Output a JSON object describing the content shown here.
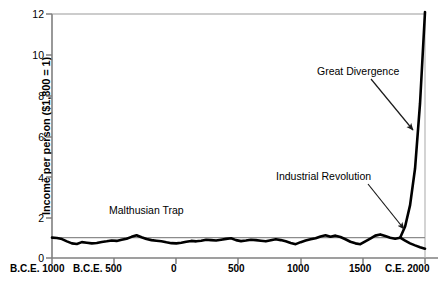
{
  "chart_data": {
    "type": "line",
    "title": "",
    "xlabel": "",
    "ylabel": "Income per person ($1,800 = 1)",
    "xlim": [
      -1000,
      2000
    ],
    "ylim": [
      0,
      12
    ],
    "grid": false,
    "legend": "none",
    "y_ticks": [
      "12",
      "10",
      "8",
      "6",
      "4",
      "2",
      "0"
    ],
    "y_tick_values": [
      12,
      10,
      8,
      6,
      4,
      2,
      0
    ],
    "x_ticks": [
      "B.C.E. 1000",
      "B.C.E. 500",
      "0",
      "500",
      "1000",
      "1500",
      "C.E. 2000"
    ],
    "x_tick_values": [
      -1000,
      -500,
      0,
      500,
      1000,
      1500,
      2000
    ],
    "reference_line": {
      "label": "",
      "y": 1,
      "color": "#8c8c8c"
    },
    "annotations": [
      {
        "name": "malthusian-trap",
        "text": "Malthusian Trap",
        "x": 470,
        "y": 2.0
      },
      {
        "name": "industrial-revolution",
        "text": "Industrial Revolution",
        "x": 1430,
        "y": 4.0
      },
      {
        "name": "great-divergence",
        "text": "Great Divergence",
        "x": 1600,
        "y": 9.1
      }
    ],
    "series": [
      {
        "name": "World income per person (Malthusian era and Great Divergence)",
        "color": "#000000",
        "x": [
          -1000,
          -960,
          -920,
          -880,
          -840,
          -800,
          -760,
          -720,
          -680,
          -640,
          -600,
          -560,
          -520,
          -480,
          -440,
          -400,
          -360,
          -320,
          -280,
          -240,
          -200,
          -160,
          -120,
          -80,
          -40,
          0,
          40,
          80,
          120,
          160,
          200,
          240,
          280,
          320,
          360,
          400,
          440,
          480,
          520,
          560,
          600,
          640,
          680,
          720,
          760,
          800,
          840,
          880,
          920,
          960,
          1000,
          1040,
          1080,
          1120,
          1160,
          1200,
          1240,
          1280,
          1320,
          1360,
          1400,
          1440,
          1480,
          1520,
          1560,
          1600,
          1640,
          1680,
          1720,
          1760,
          1800,
          1840,
          1880,
          1920,
          1960,
          2000
        ],
        "values": [
          1.0,
          0.98,
          0.93,
          0.82,
          0.72,
          0.69,
          0.78,
          0.75,
          0.72,
          0.74,
          0.79,
          0.82,
          0.86,
          0.84,
          0.9,
          0.95,
          1.04,
          1.12,
          1.02,
          0.93,
          0.88,
          0.85,
          0.82,
          0.77,
          0.73,
          0.72,
          0.75,
          0.8,
          0.84,
          0.82,
          0.85,
          0.9,
          0.88,
          0.86,
          0.9,
          0.94,
          0.97,
          0.88,
          0.83,
          0.86,
          0.9,
          0.88,
          0.85,
          0.82,
          0.87,
          0.92,
          0.88,
          0.82,
          0.74,
          0.68,
          0.78,
          0.86,
          0.92,
          0.97,
          1.06,
          1.12,
          1.05,
          1.1,
          1.03,
          0.92,
          0.8,
          0.72,
          0.68,
          0.82,
          0.95,
          1.1,
          1.16,
          1.08,
          1.0,
          0.95,
          1.0,
          1.55,
          2.6,
          4.4,
          7.6,
          12.8
        ]
      },
      {
        "name": "Poor countries after divergence",
        "color": "#000000",
        "x": [
          1800,
          1840,
          1880,
          1920,
          1960,
          2000
        ],
        "values": [
          1.0,
          0.85,
          0.72,
          0.62,
          0.53,
          0.46
        ]
      }
    ]
  },
  "caption": {
    "label": "",
    "text": ""
  }
}
